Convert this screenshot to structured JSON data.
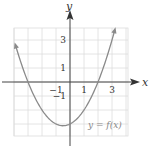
{
  "chart_data": {
    "type": "line",
    "title": "",
    "xlabel": "x",
    "ylabel": "y",
    "function_label": "y = f(x)",
    "x_ticks": [
      {
        "value": -1,
        "label": "−1"
      },
      {
        "value": 1,
        "label": "1"
      },
      {
        "value": 3,
        "label": "3"
      }
    ],
    "y_ticks": [
      {
        "value": 3,
        "label": "3"
      },
      {
        "value": 1,
        "label": "1"
      },
      {
        "value": -1,
        "label": "−1"
      }
    ],
    "xlim": [
      -4,
      4
    ],
    "ylim": [
      -4,
      4
    ],
    "grid": true,
    "series": [
      {
        "name": "f(x)",
        "description": "upward parabola, roots at x=-3 and x=2, vertex near (-0.5, -3.1), arrows at both ends",
        "x": [
          -3.9,
          -3,
          -2,
          -1,
          -0.5,
          0,
          1,
          2,
          3.2
        ],
        "values": [
          2.65,
          0,
          -2,
          -3,
          -3.1,
          -3,
          -2,
          0,
          3.7
        ]
      }
    ],
    "curve_color": "#8a8a8a",
    "grid_color": "#dddddd",
    "axis_color": "#444444"
  }
}
